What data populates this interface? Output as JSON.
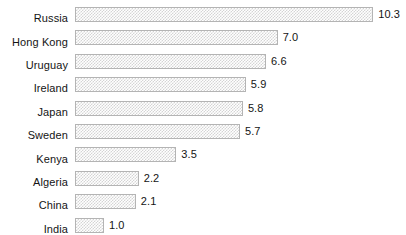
{
  "chart_data": {
    "type": "bar",
    "orientation": "horizontal",
    "title": "",
    "subtitle": "",
    "xlabel": "",
    "ylabel": "",
    "grid": false,
    "legend": false,
    "axis_visible": false,
    "xlim": [
      0,
      10.3
    ],
    "categories": [
      "Russia",
      "Hong Kong",
      "Uruguay",
      "Ireland",
      "Japan",
      "Sweden",
      "Kenya",
      "Algeria",
      "China",
      "India"
    ],
    "values": [
      10.3,
      7.0,
      6.6,
      5.9,
      5.8,
      5.7,
      3.5,
      2.2,
      2.1,
      1.0
    ],
    "value_labels": [
      "10.3",
      "7.0",
      "6.6",
      "5.9",
      "5.8",
      "5.7",
      "3.5",
      "2.2",
      "2.1",
      "1.0"
    ],
    "data_labels_position": "outside-end",
    "bar_fill": "#d4d4d4",
    "bar_fill_pattern": "checkerboard-dither",
    "bar_border": "#b4b4b4",
    "background": "#ffffff",
    "text_color": "#141414",
    "rows": [
      {
        "category": "Russia",
        "value": 10.3,
        "label": "10.3"
      },
      {
        "category": "Hong Kong",
        "value": 7.0,
        "label": "7.0"
      },
      {
        "category": "Uruguay",
        "value": 6.6,
        "label": "6.6"
      },
      {
        "category": "Ireland",
        "value": 5.9,
        "label": "5.9"
      },
      {
        "category": "Japan",
        "value": 5.8,
        "label": "5.8"
      },
      {
        "category": "Sweden",
        "value": 5.7,
        "label": "5.7"
      },
      {
        "category": "Kenya",
        "value": 3.5,
        "label": "3.5"
      },
      {
        "category": "Algeria",
        "value": 2.2,
        "label": "2.2"
      },
      {
        "category": "China",
        "value": 2.1,
        "label": "2.1"
      },
      {
        "category": "India",
        "value": 1.0,
        "label": "1.0"
      }
    ]
  },
  "layout": {
    "bar_origin_x": 75,
    "px_per_unit": 28.95,
    "row_pitch": 23.4,
    "first_row_top": 7,
    "bar_height": 15,
    "label_gap": 5
  }
}
